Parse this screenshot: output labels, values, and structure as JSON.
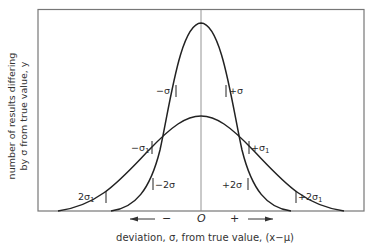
{
  "diagram": {
    "type": "normal-distribution-comparison",
    "y_axis_label_line1": "number of results differing",
    "y_axis_label_line2": "by σ from true value, y",
    "x_axis_label": "deviation, σ, from true value, (x−μ)",
    "x_center_label": "O",
    "x_minus_label": "−",
    "x_plus_label": "+",
    "curves": [
      {
        "name": "narrow",
        "sigma_label": "σ"
      },
      {
        "name": "wide",
        "sigma_label": "σ₁"
      }
    ],
    "annotations": {
      "minus_sigma": "−σ",
      "plus_sigma": "+σ",
      "minus_sigma1": "−σ",
      "minus_sigma1_sub": "1",
      "plus_sigma1": "+σ",
      "plus_sigma1_sub": "1",
      "minus_2sigma": "−2σ",
      "plus_2sigma": "+2σ",
      "two_sigma1": "2σ",
      "two_sigma1_sub": "1",
      "plus_2sigma1": "+2σ",
      "plus_2sigma1_sub": "1"
    }
  }
}
